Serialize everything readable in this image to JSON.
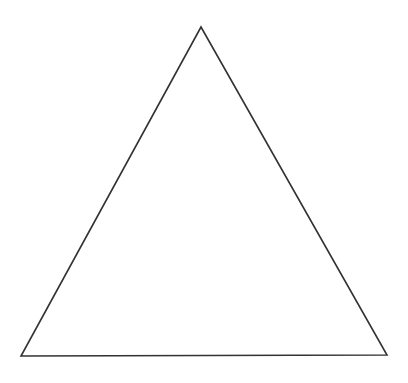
{
  "diagram": {
    "background": "#ffffff",
    "shapes": [
      {
        "type": "triangle",
        "kind": "equilateral-outline",
        "vertices": [
          [
            201,
            27
          ],
          [
            21,
            356
          ],
          [
            387,
            355
          ]
        ],
        "stroke": "#333333",
        "stroke_width": 1.6,
        "fill": "none"
      }
    ]
  }
}
